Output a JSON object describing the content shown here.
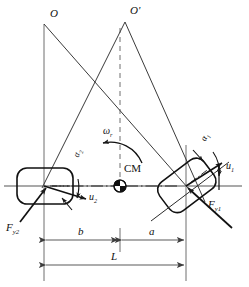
{
  "figure": {
    "type": "engineering-diagram",
    "background_color": "#ffffff",
    "line_color": "#1a1a1a",
    "axis_color": "#808080",
    "width": 249,
    "height": 287
  },
  "labels": {
    "center_o": "O",
    "center_o_prime": "O'",
    "yaw_rate": "ω",
    "yaw_rate_sub": "r",
    "cm": "CM",
    "alpha": "α",
    "alpha1_sub": "1",
    "alpha2_sub": "2",
    "u": "u",
    "u1_sub": "1",
    "u2_sub": "2",
    "force": "F",
    "force1_sub": "y1",
    "force2_sub": "y2",
    "dim_a": "a",
    "dim_b": "b",
    "dim_L": "L"
  },
  "geometry": {
    "o_apex": [
      44,
      24
    ],
    "o_prime_apex": [
      125,
      22
    ],
    "left_wheel_center": [
      44,
      186
    ],
    "right_wheel_center": [
      186,
      186
    ],
    "cm_marker": [
      120,
      186
    ],
    "axis_y": 186,
    "dim_line_b_a_y": 240,
    "dim_line_L_y": 265,
    "left_vertical_x": 44,
    "right_vertical_x": 186,
    "center_vertical_x": 120,
    "right_wheel_rotation_deg": -37,
    "left_wheel_rotation_deg": 0
  },
  "colors": {
    "ink": "#1a1a1a",
    "axis_gray": "#8c8c8c",
    "dim_gray": "#6b6b6b"
  }
}
